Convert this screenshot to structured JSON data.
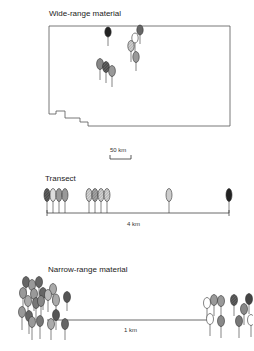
{
  "panels": {
    "wide": {
      "title": "Wide-range material",
      "scale_label": "50 km",
      "trees": [
        {
          "x": 108,
          "y": 32,
          "fill": "dark"
        },
        {
          "x": 140,
          "y": 30,
          "fill": "medium-dark"
        },
        {
          "x": 135,
          "y": 38,
          "fill": "white"
        },
        {
          "x": 131,
          "y": 46,
          "fill": "hatched"
        },
        {
          "x": 136,
          "y": 57,
          "fill": "medium"
        },
        {
          "x": 100,
          "y": 64,
          "fill": "medium"
        },
        {
          "x": 106,
          "y": 67,
          "fill": "dark-hatched"
        },
        {
          "x": 112,
          "y": 71,
          "fill": "medium"
        }
      ]
    },
    "transect": {
      "title": "Transect",
      "distance_label": "4 km",
      "trees": [
        {
          "x": 47,
          "fill": "dark-hatched"
        },
        {
          "x": 53,
          "fill": "light"
        },
        {
          "x": 59,
          "fill": "medium"
        },
        {
          "x": 65,
          "fill": "medium"
        },
        {
          "x": 89,
          "fill": "hatched"
        },
        {
          "x": 95,
          "fill": "medium-hatched"
        },
        {
          "x": 101,
          "fill": "hatched"
        },
        {
          "x": 107,
          "fill": "hatched"
        },
        {
          "x": 169,
          "fill": "light"
        },
        {
          "x": 229,
          "fill": "dark"
        }
      ]
    },
    "narrow": {
      "title": "Narrow-range material",
      "distance_label": "1 km"
    }
  }
}
